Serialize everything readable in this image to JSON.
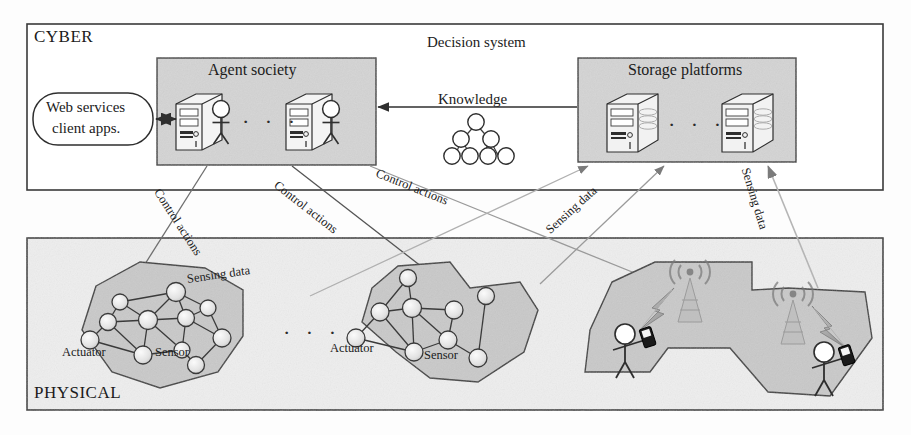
{
  "figure": {
    "type": "architecture-diagram",
    "title_visible": false
  },
  "layers": [
    {
      "id": "cyber",
      "tag": "CYBER"
    },
    {
      "id": "physical",
      "tag": "PHYSICAL"
    }
  ],
  "cyber": {
    "tag": "CYBER",
    "decision_system_label": "Decision system",
    "knowledge_label": "Knowledge",
    "web_services": {
      "line1": "Web services",
      "line2": "client apps."
    },
    "agent_society": {
      "title": "Agent society",
      "ellipsis": "· · ·",
      "node_count": 2,
      "node_kind": "server-with-agent"
    },
    "storage_platforms": {
      "title": "Storage platforms",
      "ellipsis": "· · ·",
      "node_count": 2,
      "node_kind": "storage-server"
    },
    "knowledge_tree": {
      "levels": [
        1,
        2,
        4
      ],
      "node_kind": "circle"
    }
  },
  "physical": {
    "tag": "PHYSICAL",
    "ellipsis": "· · ·",
    "clusters": [
      {
        "id": "wsn-1",
        "kind": "sensor-network",
        "actuator_label": "Actuator",
        "sensor_label": "Sensor",
        "node_count": 11
      },
      {
        "id": "wsn-2",
        "kind": "sensor-network",
        "actuator_label": "Actuator",
        "sensor_label": "Sensor",
        "node_count": 9
      },
      {
        "id": "cellular",
        "kind": "mobile-network",
        "tower_count": 2,
        "user_count": 2
      }
    ]
  },
  "edges": [
    {
      "id": "e-webservices",
      "label": "",
      "style": "double-arrow",
      "from": "web-services",
      "to": "agent-society"
    },
    {
      "id": "e-knowledge",
      "label": "Knowledge",
      "style": "arrow",
      "from": "storage-platforms",
      "to": "agent-society"
    },
    {
      "id": "e-control-1",
      "label": "Control actions",
      "style": "arrow",
      "from": "agent-society",
      "to": "wsn-1"
    },
    {
      "id": "e-control-2",
      "label": "Control actions",
      "style": "arrow",
      "from": "agent-society",
      "to": "wsn-2"
    },
    {
      "id": "e-control-3",
      "label": "Control actions",
      "style": "arrow",
      "from": "agent-society",
      "to": "cellular"
    },
    {
      "id": "e-sensing-1",
      "label": "Sensing data",
      "style": "arrow",
      "from": "wsn-1",
      "to": "storage-platforms"
    },
    {
      "id": "e-sensing-2",
      "label": "Sensing data",
      "style": "arrow",
      "from": "wsn-2",
      "to": "storage-platforms"
    },
    {
      "id": "e-sensing-3",
      "label": "Sensing data",
      "style": "arrow",
      "from": "cellular",
      "to": "storage-platforms"
    }
  ],
  "colors": {
    "stroke": "#3a3a3a",
    "light_stroke": "#9a9a9a",
    "panel_fill": "#d6d6d6",
    "layer_fill": "#ececec",
    "cluster_fill": "#c9c9c9",
    "node_fill": "#e8e8e8",
    "text": "#1b1b1b"
  }
}
